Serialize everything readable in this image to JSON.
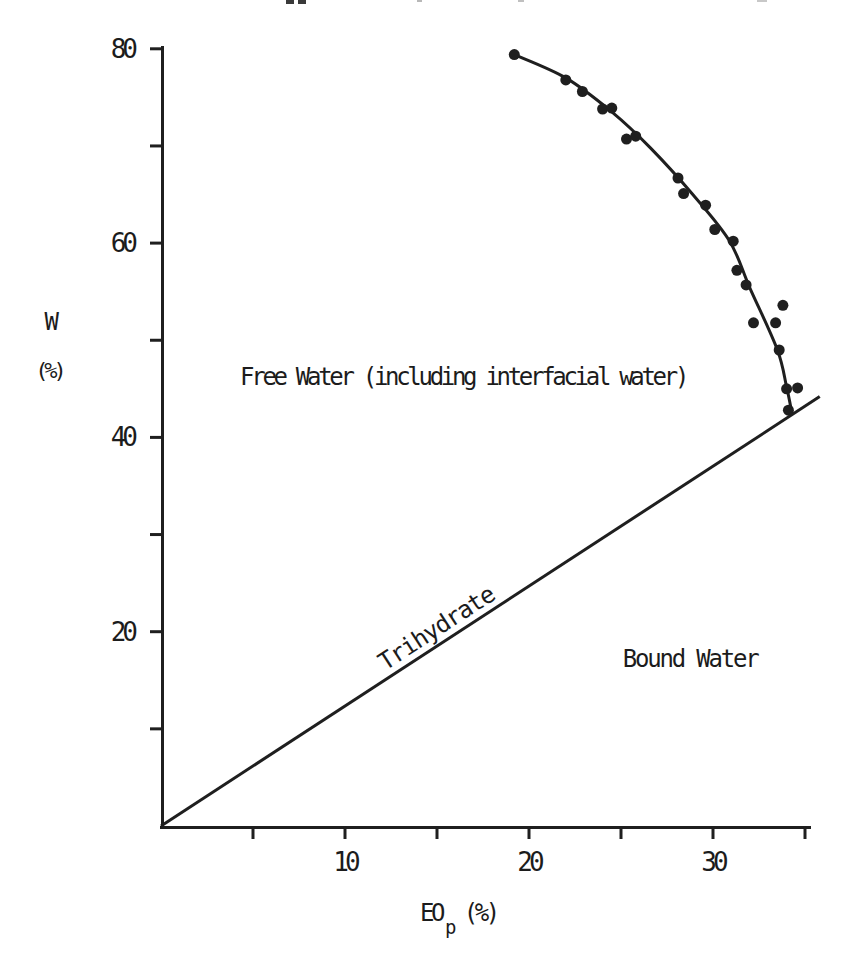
{
  "figure": {
    "background": "#ffffff",
    "ink_color": "#1f1f1f"
  },
  "chart_data": {
    "type": "scatter",
    "title": "",
    "xlabel_base": "EO",
    "xlabel_sub": "p",
    "xlabel_unit": "(%)",
    "ylabel_line1": "W",
    "ylabel_line2": "(%)",
    "xlim": [
      0,
      36
    ],
    "ylim": [
      0,
      82
    ],
    "grid": false,
    "legend": null,
    "x_ticks": {
      "labeled": [
        10,
        20,
        30
      ],
      "all": [
        5,
        10,
        15,
        20,
        25,
        30,
        35
      ]
    },
    "y_ticks": {
      "labeled": [
        20,
        40,
        60,
        80
      ],
      "all": [
        10,
        20,
        30,
        40,
        50,
        60,
        70,
        80
      ]
    },
    "series": [
      {
        "name": "water-content-data",
        "marker": "filled-circle",
        "points": [
          [
            19.2,
            79.4
          ],
          [
            22.0,
            76.8
          ],
          [
            22.9,
            75.6
          ],
          [
            24.0,
            73.8
          ],
          [
            24.5,
            73.9
          ],
          [
            25.3,
            70.7
          ],
          [
            25.8,
            71.0
          ],
          [
            28.1,
            66.7
          ],
          [
            28.4,
            65.1
          ],
          [
            29.6,
            63.9
          ],
          [
            30.1,
            61.4
          ],
          [
            31.1,
            60.2
          ],
          [
            31.3,
            57.2
          ],
          [
            31.8,
            55.7
          ],
          [
            33.8,
            53.6
          ],
          [
            32.2,
            51.8
          ],
          [
            33.4,
            51.8
          ],
          [
            33.6,
            49.0
          ],
          [
            34.0,
            45.0
          ],
          [
            34.6,
            45.1
          ],
          [
            34.1,
            42.8
          ]
        ]
      }
    ],
    "fitted_curve": [
      [
        19.2,
        79.4
      ],
      [
        22.0,
        77.0
      ],
      [
        24.5,
        73.5
      ],
      [
        26.6,
        69.8
      ],
      [
        28.9,
        65.0
      ],
      [
        30.9,
        60.2
      ],
      [
        32.0,
        55.4
      ],
      [
        33.5,
        49.0
      ],
      [
        34.0,
        45.2
      ],
      [
        34.3,
        42.4
      ]
    ],
    "phase_boundary_line": {
      "from": [
        0,
        0
      ],
      "to": [
        35.8,
        44.2
      ]
    },
    "annotations": [
      {
        "text": "Free Water (including interfacial water)",
        "x": 4.3,
        "y": 46.2,
        "anchor": "start",
        "rotation": 0
      },
      {
        "text": "Bound Water",
        "x": 25.1,
        "y": 17.2,
        "anchor": "start",
        "rotation": 0
      },
      {
        "text": "Trihydrate",
        "x": 15.2,
        "y": 20.5,
        "anchor": "middle",
        "rotation": -33
      }
    ]
  }
}
